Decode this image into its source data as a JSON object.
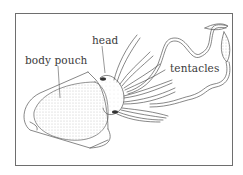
{
  "diagram": {
    "labels": {
      "body_pouch": "body pouch",
      "head": "head",
      "tentacles": "tentacles"
    },
    "colors": {
      "line": "#555555",
      "stipple": "#bdbdbd",
      "frame": "#6e6e6e",
      "label_text": "#3a3a3a"
    }
  }
}
